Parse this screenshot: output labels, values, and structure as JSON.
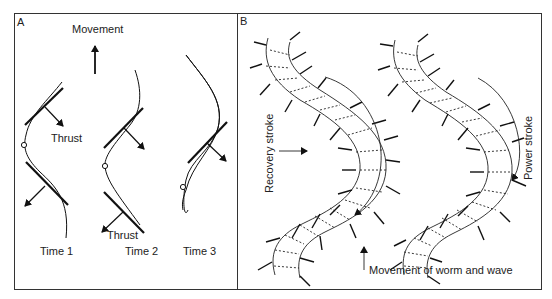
{
  "figure": {
    "panel_a": {
      "letter": "A",
      "movement_label": "Movement",
      "thrust_label_1": "Thrust",
      "thrust_label_2": "Thrust",
      "time_labels": [
        "Time 1",
        "Time 2",
        "Time 3"
      ]
    },
    "panel_b": {
      "letter": "B",
      "recovery_label": "Recovery stroke",
      "power_label": "Power stroke",
      "movement_label": "Movement of worm and wave"
    }
  }
}
